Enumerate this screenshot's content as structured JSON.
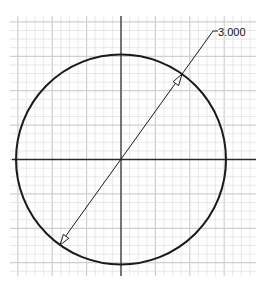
{
  "drawing": {
    "type": "circle-sketch",
    "dimension": {
      "kind": "diameter",
      "value_label": "3.000"
    },
    "grid": {
      "left": 10,
      "top": 16,
      "right": 256,
      "bottom": 276,
      "minor_spacing": 8.6,
      "minor_color": "#e2e2e2",
      "major_every": 4,
      "major_color": "#cfcfcf"
    },
    "axes": {
      "color": "#333333",
      "center": [
        121,
        159.5
      ]
    },
    "circle": {
      "cx": 121,
      "cy": 159.5,
      "r": 105,
      "color": "#1a1a1a"
    },
    "colors": {
      "background": "#ffffff",
      "dimension_line": "#1a1a1a"
    }
  }
}
